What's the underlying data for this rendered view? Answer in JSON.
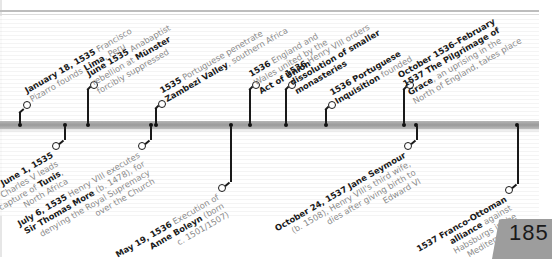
{
  "page": {
    "number": "185",
    "colors": {
      "bar": "#a8a8a8",
      "text_bold": "#1a1a1a",
      "text_light": "#8a8a8a",
      "page_tab": "#9d9d9d"
    }
  },
  "timeline": {
    "events_above": [
      {
        "id": "pizarro",
        "date": "January 18, 1535",
        "pre": "Francisco Pizarro founds ",
        "bold2": "Lima",
        "post": ", Peru"
      },
      {
        "id": "munster",
        "date": "June 1535",
        "pre": "Anabaptist rebellion at ",
        "bold2": "Münster",
        "post": " forcibly suppressed"
      },
      {
        "id": "zambezi",
        "date": "1535",
        "pre": "Portuguese penetrate ",
        "bold2": "Zambezi Valley",
        "post": ", southern Africa"
      },
      {
        "id": "union",
        "date": "1536",
        "pre": "England and Wales united by the ",
        "bold2": "Act of Union",
        "post": ""
      },
      {
        "id": "monasteries",
        "date": "1536",
        "pre": "Henry VIII orders ",
        "bold2": "dissolution of smaller monasteries",
        "post": ""
      },
      {
        "id": "inquisition",
        "date": "1536",
        "pre": "",
        "bold2": "Portuguese Inquisition",
        "post": " founded"
      },
      {
        "id": "pilgrimage",
        "date": "October 1536–February 1537",
        "pre": "",
        "bold2": "The Pilgrimage of Grace",
        "post": ", an uprising in the North of England, takes place"
      }
    ],
    "events_below": [
      {
        "id": "tunis",
        "date": "June 1, 1535",
        "pre": "Charles V leads capture of ",
        "bold2": "Tunis",
        "post": ", North Africa"
      },
      {
        "id": "more",
        "date": "July 6, 1535",
        "pre": "Henry VIII executes ",
        "bold2": "Sir Thomas More",
        "post": " (b. 1478), for denying the Royal Supremacy over the Church"
      },
      {
        "id": "boleyn",
        "date": "May 19, 1536",
        "pre": "Execution of ",
        "bold2": "Anne Boleyn",
        "post": " (born c. 1501/1507)"
      },
      {
        "id": "seymour",
        "date": "October 24, 1537",
        "pre": "",
        "bold2": "Jane Seymour",
        "post": " (b. 1508), Henry VIII's third wife, dies after giving birth to Edward VI"
      },
      {
        "id": "ottoman",
        "date": "1537",
        "pre": "",
        "bold2": "Franco-Ottoman alliance",
        "post": " against Habsburgs in the Mediterranean"
      }
    ]
  }
}
